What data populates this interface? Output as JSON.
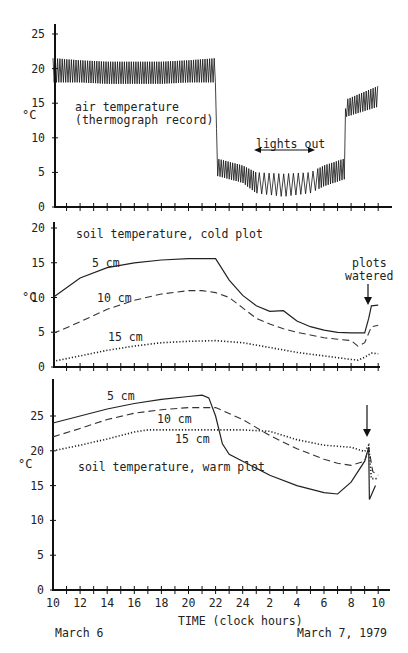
{
  "chart_data": [
    {
      "type": "line",
      "title": "air temperature (thermograph record)",
      "xlabel": "TIME (clock hours)",
      "ylabel": "°C",
      "ylim": [
        0,
        25
      ],
      "yticks": [
        0,
        5,
        10,
        15,
        20,
        25
      ],
      "annotation": "lights out",
      "annotation_range_hours": [
        1,
        5.5
      ],
      "series": [
        {
          "name": "air temperature (oscillating envelope)",
          "x": [
            "10",
            "12",
            "14",
            "16",
            "18",
            "20",
            "22",
            "22.1",
            "24",
            "1",
            "3",
            "5",
            "6",
            "7.5",
            "7.6",
            "10"
          ],
          "upper": [
            21.5,
            21.2,
            21.0,
            21.0,
            21.0,
            21.2,
            21.5,
            7.0,
            6.0,
            5.0,
            4.8,
            5.0,
            6.0,
            7.0,
            15.5,
            17.5
          ],
          "lower": [
            18.0,
            18.0,
            17.8,
            17.8,
            17.8,
            18.0,
            18.0,
            4.5,
            3.5,
            2.0,
            1.5,
            2.0,
            3.0,
            4.0,
            13.0,
            14.5
          ]
        }
      ]
    },
    {
      "type": "line",
      "title": "soil temperature, cold plot",
      "ylabel": "°C",
      "ylim": [
        0,
        20
      ],
      "yticks": [
        0,
        5,
        10,
        15,
        20
      ],
      "annotation": "plots watered",
      "annotation_hour": 9.4,
      "series": [
        {
          "name": "5 cm",
          "x": [
            10,
            12,
            14,
            16,
            18,
            20,
            22,
            23,
            24,
            25,
            26,
            27,
            28,
            29,
            30,
            31,
            32,
            33,
            33.3,
            33.5,
            34
          ],
          "values": [
            10.0,
            12.8,
            14.3,
            15.0,
            15.4,
            15.6,
            15.6,
            12.5,
            10.3,
            8.8,
            8.0,
            8.1,
            6.6,
            5.8,
            5.3,
            5.0,
            4.9,
            4.9,
            7.0,
            8.8,
            8.9
          ]
        },
        {
          "name": "10 cm",
          "x": [
            10,
            12,
            14,
            16,
            18,
            20,
            21,
            22,
            23,
            24,
            25,
            26,
            27,
            28,
            29,
            30,
            31,
            32,
            32.5,
            33,
            33.5,
            34
          ],
          "values": [
            4.8,
            6.5,
            8.3,
            9.6,
            10.5,
            11.0,
            11.0,
            10.7,
            10.0,
            8.5,
            7.0,
            6.2,
            5.5,
            5.0,
            4.6,
            4.2,
            4.0,
            3.8,
            3.0,
            3.5,
            5.8,
            6.0
          ]
        },
        {
          "name": "15 cm",
          "x": [
            10,
            12,
            14,
            16,
            18,
            20,
            22,
            24,
            26,
            28,
            30,
            32,
            32.5,
            33,
            33.5,
            34
          ],
          "values": [
            0.8,
            1.6,
            2.4,
            3.0,
            3.5,
            3.7,
            3.8,
            3.5,
            2.8,
            2.1,
            1.6,
            1.1,
            1.0,
            1.4,
            2.0,
            1.9
          ]
        }
      ]
    },
    {
      "type": "line",
      "title": "soil temperature, warm plot",
      "ylabel": "°C",
      "ylim": [
        0,
        30
      ],
      "yticks": [
        0,
        5,
        10,
        15,
        20,
        25
      ],
      "xticks": [
        "10",
        "12",
        "14",
        "16",
        "18",
        "20",
        "22",
        "24",
        "2",
        "4",
        "6",
        "8",
        "10"
      ],
      "annotation": "watering arrow at ~9.4 h",
      "series": [
        {
          "name": "5 cm",
          "x": [
            10,
            12,
            14,
            16,
            18,
            20,
            21,
            21.5,
            22,
            22.5,
            23,
            24,
            26,
            28,
            30,
            31,
            32,
            33,
            33.3,
            33.35,
            33.8
          ],
          "values": [
            24.0,
            25.0,
            26.0,
            26.8,
            27.4,
            27.8,
            28.0,
            27.6,
            25.0,
            21.0,
            19.5,
            18.5,
            16.5,
            15.0,
            14.0,
            13.8,
            15.5,
            18.5,
            20.5,
            13.0,
            15.0
          ]
        },
        {
          "name": "10 cm",
          "x": [
            10,
            12,
            14,
            16,
            18,
            20,
            22,
            24,
            26,
            28,
            30,
            31,
            32,
            33,
            33.3,
            33.6,
            34
          ],
          "values": [
            22.0,
            23.2,
            24.5,
            25.4,
            25.9,
            26.2,
            26.2,
            24.5,
            22.2,
            20.3,
            18.8,
            18.2,
            17.9,
            18.5,
            20.5,
            17.0,
            16.5
          ]
        },
        {
          "name": "15 cm",
          "x": [
            10,
            12,
            14,
            16,
            17,
            18,
            20,
            22,
            24,
            26,
            28,
            30,
            32,
            33,
            33.3,
            33.5,
            34
          ],
          "values": [
            20.0,
            20.8,
            21.7,
            22.7,
            23.0,
            23.0,
            23.0,
            23.0,
            23.0,
            22.8,
            21.6,
            20.8,
            20.5,
            19.9,
            20.8,
            16.0,
            16.0
          ]
        }
      ]
    }
  ],
  "panels": {
    "air": {
      "label_line1": "air temperature",
      "label_line2": "(thermograph record)",
      "unit": "°C",
      "lights_out": "lights out",
      "yticks": [
        "25",
        "20",
        "15",
        "10",
        "5",
        "0"
      ]
    },
    "cold": {
      "label": "soil temperature, cold plot",
      "unit": "°C",
      "depth_5": "5 cm",
      "depth_10": "10 cm",
      "depth_15": "15 cm",
      "watered_line1": "plots",
      "watered_line2": "watered",
      "yticks": [
        "20",
        "15",
        "10",
        "5",
        "0"
      ]
    },
    "warm": {
      "label": "soil temperature, warm plot",
      "unit": "°C",
      "depth_5": "5 cm",
      "depth_10": "10 cm",
      "depth_15": "15 cm",
      "yticks": [
        "25",
        "20",
        "15",
        "10",
        "5",
        "0"
      ]
    }
  },
  "x_axis": {
    "title": "TIME (clock hours)",
    "ticks": [
      "10",
      "12",
      "14",
      "16",
      "18",
      "20",
      "22",
      "24",
      "2",
      "4",
      "6",
      "8",
      "10"
    ],
    "date_left": "March 6",
    "date_right": "March 7, 1979"
  }
}
